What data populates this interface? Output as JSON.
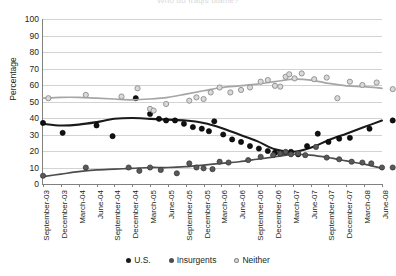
{
  "chart_data": {
    "type": "scatter",
    "title": "Who do Iraqis blame?",
    "xlabel": "",
    "ylabel": "Percentage",
    "ylim": [
      0,
      100
    ],
    "ytick_step": 10,
    "yticks": [
      100,
      90,
      80,
      70,
      60,
      50,
      40,
      30,
      20,
      10,
      0
    ],
    "grid": true,
    "legend_position": "bottom",
    "categories": [
      "September-03",
      "December-03",
      "March-04",
      "June-04",
      "September-04",
      "December-04",
      "March-05",
      "June-05",
      "September-05",
      "December-05",
      "March-06",
      "June-06",
      "September-06",
      "December-06",
      "March-07",
      "June-07",
      "September-07",
      "December-07",
      "March-08",
      "June-08"
    ],
    "series": [
      {
        "name": "U.S.",
        "color": "#1a1a1a",
        "trend": [
          36.5,
          35.5,
          36.0,
          37.5,
          39.5,
          40.0,
          39.5,
          39.0,
          38.5,
          37.0,
          34.0,
          30.0,
          26.0,
          21.0,
          19.5,
          22.0,
          26.5,
          30.5,
          34.5,
          38.5
        ],
        "points": [
          [
            0,
            37
          ],
          [
            1.1,
            31
          ],
          [
            3.0,
            35.5
          ],
          [
            3.9,
            29
          ],
          [
            5.2,
            52
          ],
          [
            6.0,
            42.5
          ],
          [
            6.5,
            39.5
          ],
          [
            6.9,
            38.5
          ],
          [
            7.4,
            38.5
          ],
          [
            7.9,
            36.5
          ],
          [
            8.4,
            34.5
          ],
          [
            8.9,
            33.5
          ],
          [
            9.3,
            32.0
          ],
          [
            9.6,
            38.0
          ],
          [
            10.1,
            30.0
          ],
          [
            10.6,
            27.0
          ],
          [
            11.1,
            25.5
          ],
          [
            11.6,
            23.0
          ],
          [
            12.1,
            21.5
          ],
          [
            12.6,
            20.0
          ],
          [
            13.0,
            19.0
          ],
          [
            13.3,
            18.5
          ],
          [
            13.6,
            19.0
          ],
          [
            13.9,
            19.5
          ],
          [
            14.3,
            18.0
          ],
          [
            14.8,
            23.0
          ],
          [
            15.4,
            30.5
          ],
          [
            16.0,
            25.5
          ],
          [
            16.6,
            27.5
          ],
          [
            17.2,
            28.0
          ],
          [
            18.3,
            33.5
          ],
          [
            19.6,
            38.5
          ]
        ],
        "marker": "filled-circle"
      },
      {
        "name": "Insurgents",
        "color": "#4d4d4d",
        "trend": [
          4.5,
          6.0,
          7.5,
          8.5,
          9.0,
          9.5,
          10.0,
          10.0,
          10.5,
          11.5,
          12.5,
          13.5,
          15.0,
          16.5,
          18.0,
          17.5,
          16.0,
          14.0,
          12.0,
          9.5
        ],
        "points": [
          [
            0,
            5
          ],
          [
            2.4,
            10
          ],
          [
            4.8,
            10
          ],
          [
            5.4,
            8
          ],
          [
            6.0,
            10
          ],
          [
            6.6,
            8.5
          ],
          [
            7.5,
            6.5
          ],
          [
            8.2,
            12.5
          ],
          [
            8.6,
            10.0
          ],
          [
            9.0,
            9.5
          ],
          [
            9.5,
            9.0
          ],
          [
            9.9,
            13.5
          ],
          [
            10.4,
            13.0
          ],
          [
            11.5,
            14.5
          ],
          [
            12.2,
            16.5
          ],
          [
            12.9,
            17.5
          ],
          [
            13.3,
            18.5
          ],
          [
            13.6,
            19.5
          ],
          [
            13.9,
            18.0
          ],
          [
            14.3,
            18.5
          ],
          [
            14.7,
            17.5
          ],
          [
            15.3,
            22.5
          ],
          [
            15.9,
            16.0
          ],
          [
            16.6,
            15.0
          ],
          [
            17.3,
            13.5
          ],
          [
            17.9,
            13.0
          ],
          [
            18.4,
            12.5
          ],
          [
            19.0,
            10.0
          ],
          [
            19.6,
            10.0
          ]
        ],
        "marker": "grey-circle"
      },
      {
        "name": "Neither",
        "color": "#a6a6a6",
        "trend": [
          52.0,
          52.5,
          52.5,
          52.0,
          51.5,
          51.0,
          51.5,
          52.5,
          54.5,
          56.5,
          58.5,
          59.5,
          60.5,
          62.0,
          63.5,
          63.0,
          61.0,
          59.5,
          59.0,
          58.0
        ],
        "points": [
          [
            0.3,
            52
          ],
          [
            2.4,
            54
          ],
          [
            4.4,
            53
          ],
          [
            5.3,
            58
          ],
          [
            6.0,
            45.5
          ],
          [
            6.2,
            44.5
          ],
          [
            6.9,
            48.5
          ],
          [
            8.2,
            50.5
          ],
          [
            8.6,
            52.5
          ],
          [
            9.0,
            51.5
          ],
          [
            9.4,
            55.5
          ],
          [
            9.9,
            58.5
          ],
          [
            10.5,
            55.5
          ],
          [
            11.1,
            57.0
          ],
          [
            11.6,
            58.5
          ],
          [
            12.2,
            62.0
          ],
          [
            12.6,
            63.0
          ],
          [
            13.0,
            59.5
          ],
          [
            13.3,
            59.0
          ],
          [
            13.6,
            65.0
          ],
          [
            13.8,
            66.5
          ],
          [
            14.1,
            64.0
          ],
          [
            14.5,
            67.0
          ],
          [
            15.2,
            63.5
          ],
          [
            15.9,
            64.5
          ],
          [
            16.5,
            52.0
          ],
          [
            17.2,
            62.0
          ],
          [
            17.9,
            60.0
          ],
          [
            18.7,
            61.5
          ],
          [
            19.6,
            57.5
          ]
        ],
        "marker": "open-circle"
      }
    ]
  },
  "legend": {
    "items": [
      {
        "label": "U.S."
      },
      {
        "label": "Insurgents"
      },
      {
        "label": "Neither"
      }
    ]
  }
}
